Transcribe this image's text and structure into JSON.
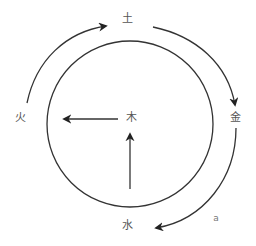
{
  "diagram": {
    "title": "",
    "colors": {
      "stroke": "#333333",
      "text": "#555555",
      "background": "#ffffff"
    },
    "nodes": [
      {
        "id": "earth",
        "label": "土",
        "x": 127,
        "y": 18
      },
      {
        "id": "fire",
        "label": "火",
        "x": 20,
        "y": 117
      },
      {
        "id": "wood",
        "label": "木",
        "x": 131,
        "y": 117
      },
      {
        "id": "metal",
        "label": "金",
        "x": 235,
        "y": 117
      },
      {
        "id": "water",
        "label": "水",
        "x": 127,
        "y": 225
      }
    ],
    "annotation": {
      "label": "a",
      "x": 216,
      "y": 218
    },
    "circle": {
      "cx": 130,
      "cy": 124,
      "r": 83
    },
    "arrows": [
      {
        "from": "fire",
        "to": "earth",
        "type": "arc"
      },
      {
        "from": "earth",
        "to": "metal",
        "type": "arc"
      },
      {
        "from": "metal",
        "to": "water",
        "type": "arc"
      },
      {
        "from": "wood",
        "to": "fire",
        "type": "straight"
      },
      {
        "from": "water",
        "to": "wood",
        "type": "straight"
      }
    ]
  }
}
